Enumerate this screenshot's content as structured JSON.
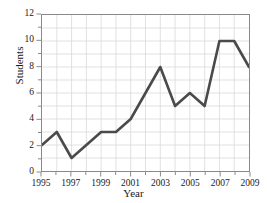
{
  "chart_data": {
    "type": "line",
    "title": "",
    "xlabel": "Year",
    "ylabel": "Students",
    "x": [
      1995,
      1996,
      1997,
      1998,
      1999,
      2000,
      2001,
      2002,
      2003,
      2004,
      2005,
      2006,
      2007,
      2008,
      2009
    ],
    "values": [
      2,
      3,
      1,
      2,
      3,
      3,
      4,
      6,
      8,
      5,
      6,
      5,
      10,
      10,
      8
    ],
    "series": [
      {
        "name": "Students",
        "values": [
          2,
          3,
          1,
          2,
          3,
          3,
          4,
          6,
          8,
          5,
          6,
          5,
          10,
          10,
          8
        ]
      }
    ],
    "xlim": [
      1995,
      2009
    ],
    "ylim": [
      0,
      12
    ],
    "xticks": [
      1995,
      1996,
      1997,
      1998,
      1999,
      2000,
      2001,
      2002,
      2003,
      2004,
      2005,
      2006,
      2007,
      2008,
      2009
    ],
    "xtick_labels": [
      "1995",
      "",
      "1997",
      "",
      "1999",
      "",
      "2001",
      "",
      "2003",
      "",
      "2005",
      "",
      "2007",
      "",
      "2009"
    ],
    "yticks": [
      0,
      1,
      2,
      3,
      4,
      5,
      6,
      7,
      8,
      9,
      10,
      11,
      12
    ],
    "ytick_labels": [
      "0",
      "",
      "2",
      "",
      "4",
      "",
      "6",
      "",
      "8",
      "",
      "10",
      "",
      "12"
    ],
    "grid": true,
    "grid_color": "#d9d9d9",
    "line_color": "#4a4a4a",
    "line_width": 2.6,
    "markers": false,
    "legend": false,
    "legend_position": "none",
    "axis_color": "#8a8a8a",
    "background": "#ffffff"
  }
}
